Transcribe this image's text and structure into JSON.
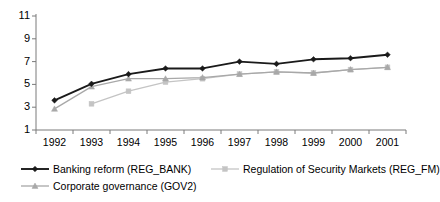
{
  "chart_data": {
    "type": "line",
    "title": "",
    "subtitle": "",
    "xlabel": "",
    "ylabel": "",
    "categories": [
      "1992",
      "1993",
      "1994",
      "1995",
      "1996",
      "1997",
      "1998",
      "1999",
      "2000",
      "2001"
    ],
    "x": [
      1992,
      1993,
      1994,
      1995,
      1996,
      1997,
      1998,
      1999,
      2000,
      2001
    ],
    "ylim": [
      1,
      11
    ],
    "yticks": [
      1,
      3,
      5,
      7,
      9,
      11
    ],
    "ytick_labels": [
      "1",
      "3",
      "5",
      "7",
      "9",
      "11"
    ],
    "grid": false,
    "legend_position": "bottom",
    "series": [
      {
        "name": "Banking reform (REG_BANK)",
        "key": "REG_BANK",
        "color": "#1a1a1a",
        "marker": "diamond",
        "values": [
          3.6,
          5.05,
          5.9,
          6.4,
          6.4,
          7.0,
          6.8,
          7.2,
          7.3,
          7.6
        ]
      },
      {
        "name": "Regulation of Security Markets (REG_FM)",
        "key": "REG_FM",
        "color": "#c4c4c4",
        "marker": "square",
        "values": [
          null,
          3.3,
          4.4,
          5.2,
          5.5,
          5.9,
          6.1,
          6.0,
          6.3,
          6.5
        ]
      },
      {
        "name": "Corporate governance (GOV2)",
        "key": "GOV2",
        "color": "#a8a8a8",
        "marker": "triangle",
        "values": [
          2.85,
          4.8,
          5.5,
          5.5,
          5.6,
          5.9,
          6.1,
          6.0,
          6.3,
          6.5
        ]
      }
    ]
  },
  "axes": {
    "y_axis_name": "value-axis",
    "x_axis_name": "year-axis"
  },
  "legend": {
    "entries": [
      {
        "label": "Banking reform (REG_BANK)"
      },
      {
        "label": "Regulation of Security Markets (REG_FM)"
      },
      {
        "label": "Corporate governance (GOV2)"
      }
    ]
  },
  "colors": {
    "series_reg_bank": "#1a1a1a",
    "series_reg_fm": "#c4c4c4",
    "series_gov2": "#a8a8a8",
    "axis": "#7a7a7a",
    "background": "#ffffff"
  }
}
